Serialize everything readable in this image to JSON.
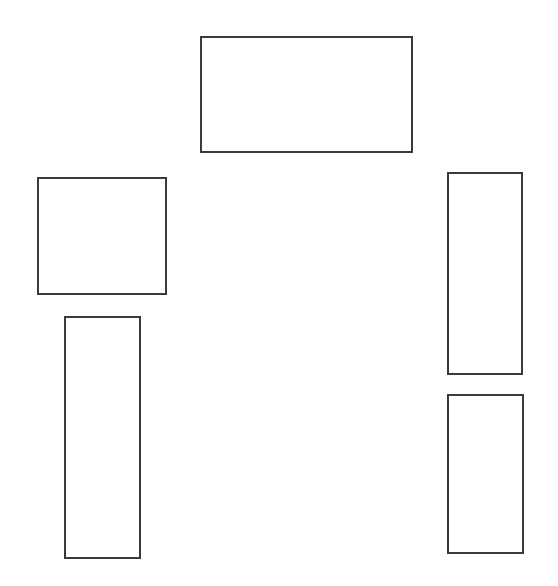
{
  "diagram": {
    "background": "#ffffff",
    "stroke_color": "#3a3a3a",
    "stroke_width": 2,
    "shapes": [
      {
        "id": "top-center-rect",
        "type": "rectangle",
        "x": 200,
        "y": 36,
        "width": 213,
        "height": 117
      },
      {
        "id": "left-square",
        "type": "rectangle",
        "x": 37,
        "y": 177,
        "width": 130,
        "height": 118
      },
      {
        "id": "left-tall-rect",
        "type": "rectangle",
        "x": 64,
        "y": 316,
        "width": 77,
        "height": 243
      },
      {
        "id": "right-upper-rect",
        "type": "rectangle",
        "x": 447,
        "y": 172,
        "width": 76,
        "height": 203
      },
      {
        "id": "right-lower-rect",
        "type": "rectangle",
        "x": 447,
        "y": 394,
        "width": 77,
        "height": 160
      }
    ]
  }
}
